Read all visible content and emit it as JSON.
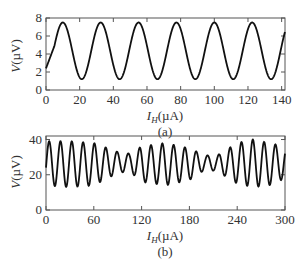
{
  "chart_data": [
    {
      "id": "a",
      "type": "line",
      "caption": "(a)",
      "title": "",
      "xlabel": "I_H (µA)",
      "ylabel": "V (µV)",
      "xlim": [
        0,
        142
      ],
      "ylim": [
        0,
        8
      ],
      "xticks": [
        0,
        20,
        40,
        60,
        80,
        100,
        120,
        140
      ],
      "yticks": [
        0,
        2,
        4,
        6,
        8
      ],
      "grid": false,
      "legend": null,
      "series": [
        {
          "name": "V",
          "model": "sinusoid",
          "offset": 4.35,
          "amplitude": 3.15,
          "period": 22.5,
          "first_peak_x": 10,
          "x": [
            0,
            10,
            21,
            33,
            43,
            55,
            66,
            78,
            88,
            100,
            111,
            122,
            133,
            142
          ],
          "values": [
            2.4,
            7.5,
            1.2,
            7.5,
            1.2,
            7.5,
            1.2,
            7.5,
            1.2,
            7.4,
            1.2,
            7.3,
            1.3,
            6.0
          ]
        }
      ]
    },
    {
      "id": "b",
      "type": "line",
      "caption": "(b)",
      "title": "",
      "xlabel": "I_H (µA)",
      "ylabel": "V (µV)",
      "xlim": [
        0,
        300
      ],
      "ylim": [
        0,
        42
      ],
      "xticks": [
        0,
        60,
        120,
        180,
        240,
        300
      ],
      "yticks": [
        0,
        20,
        40
      ],
      "grid": false,
      "legend": null,
      "series": [
        {
          "name": "V",
          "model": "amplitude-modulated sinusoid",
          "period": 14.2,
          "first_peak_x": 4,
          "envelope_x": [
            0,
            30,
            60,
            90,
            105,
            120,
            150,
            180,
            200,
            215,
            240,
            260,
            280,
            300
          ],
          "envelope_max": [
            39,
            39,
            38,
            33,
            32,
            36,
            38,
            35,
            31,
            31,
            38,
            40,
            38,
            36
          ],
          "envelope_min": [
            14,
            13,
            14,
            21,
            22,
            16,
            14,
            17,
            23,
            22,
            15,
            13,
            14,
            18
          ],
          "start_value": 20,
          "end_value": 22
        }
      ]
    }
  ],
  "labels": {
    "a": {
      "caption": "(a)",
      "ylabel_main": "V",
      "ylabel_unit": "(µV)",
      "xlabel_main": "I",
      "xlabel_sub": "H",
      "xlabel_unit": "(µA)"
    },
    "b": {
      "caption": "(b)",
      "ylabel_main": "V",
      "ylabel_unit": "(µV)",
      "xlabel_main": "I",
      "xlabel_sub": "H",
      "xlabel_unit": "(µA)"
    }
  }
}
